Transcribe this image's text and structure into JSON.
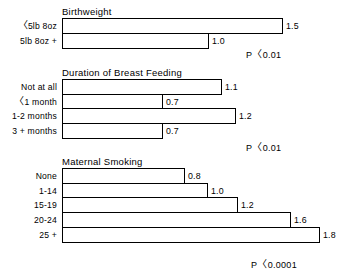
{
  "chart_data": {
    "type": "bar",
    "orientation": "horizontal",
    "title": "",
    "xlabel": "",
    "ylabel": "",
    "xlim": [
      0,
      2.0
    ],
    "grid": false,
    "legend": false,
    "panels": [
      {
        "title": "Birthweight",
        "categories": [
          "<5lb 8oz",
          "5lb 8oz +"
        ],
        "values": [
          1.5,
          1.0
        ],
        "value_labels": [
          "1.5",
          "1.0"
        ],
        "significance": "P<0.01"
      },
      {
        "title": "Duration of Breast Feeding",
        "categories": [
          "Not at all",
          "<1 month",
          "1-2 months",
          "3 + months"
        ],
        "values": [
          1.1,
          0.7,
          1.2,
          0.7
        ],
        "value_labels": [
          "1.1",
          "0.7",
          "1.2",
          "0.7"
        ],
        "significance": "P<0.01"
      },
      {
        "title": "Maternal Smoking",
        "categories": [
          "None",
          "1-14",
          "15-19",
          "20-24",
          "25 +"
        ],
        "values": [
          0.8,
          1.0,
          1.2,
          1.6,
          1.8
        ],
        "value_labels": [
          "0.8",
          "1.0",
          "1.2",
          "1.6",
          "1.8"
        ],
        "significance": "P<0.0001"
      }
    ]
  },
  "panels": [
    {
      "title": "Birthweight",
      "top": 6,
      "significance": "P<0.01",
      "sig_left": 246,
      "sig_top": 46,
      "rows": [
        {
          "label": "<5lb 8oz",
          "label_lt": true,
          "label_rest": "5lb 8oz",
          "value": "1.5",
          "width": 221
        },
        {
          "label": "5lb 8oz +",
          "label_lt": false,
          "label_rest": "5lb 8oz +",
          "value": "1.0",
          "width": 147
        }
      ]
    },
    {
      "title": "Duration of Breast Feeding",
      "top": 67,
      "significance": "P<0.01",
      "sig_left": 246,
      "sig_top": 139,
      "rows": [
        {
          "label": "Not at all",
          "label_lt": false,
          "label_rest": "Not at all",
          "value": "1.1",
          "width": 160
        },
        {
          "label": "<1 month",
          "label_lt": true,
          "label_rest": "1 month",
          "value": "0.7",
          "width": 101
        },
        {
          "label": "1-2 months",
          "label_lt": false,
          "label_rest": "1-2 months",
          "value": "1.2",
          "width": 174
        },
        {
          "label": "3 + months",
          "label_lt": false,
          "label_rest": "3 + months",
          "value": "0.7",
          "width": 101
        }
      ]
    },
    {
      "title": "Maternal Smoking",
      "top": 156,
      "significance": "P<0.0001",
      "sig_left": 251,
      "sig_top": 256,
      "rows": [
        {
          "label": "None",
          "label_lt": false,
          "label_rest": "None",
          "value": "0.8",
          "width": 123
        },
        {
          "label": "1-14",
          "label_lt": false,
          "label_rest": "1-14",
          "value": "1.0",
          "width": 146
        },
        {
          "label": "15-19",
          "label_lt": false,
          "label_rest": "15-19",
          "value": "1.2",
          "width": 176
        },
        {
          "label": "20-24",
          "label_lt": false,
          "label_rest": "20-24",
          "value": "1.6",
          "width": 229
        },
        {
          "label": "25 +",
          "label_lt": false,
          "label_rest": "25 +",
          "value": "1.8",
          "width": 258
        }
      ]
    }
  ]
}
